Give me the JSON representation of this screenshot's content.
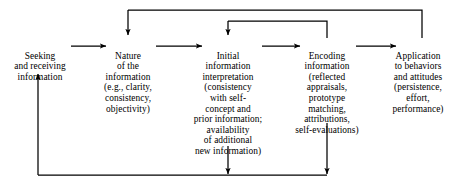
{
  "diagram": {
    "type": "process-flow",
    "background_color": "#ffffff",
    "line_color": "#000000",
    "text_color": "#000000",
    "nodes": [
      {
        "id": "seeking",
        "label": "Seeking",
        "lines": [
          "Seeking",
          "and receiving",
          "information"
        ],
        "text": "Seeking\nand receiving\ninformation"
      },
      {
        "id": "nature",
        "label": "Nature",
        "lines": [
          "Nature",
          "of the",
          "information",
          "(e.g., clarity,",
          "consistency,",
          "objectivity)"
        ],
        "text": "Nature\nof the\ninformation\n(e.g., clarity,\nconsistency,\nobjectivity)"
      },
      {
        "id": "initial-interpretation",
        "label": "Initial",
        "lines": [
          "Initial",
          "information",
          "interpretation",
          "(consistency",
          "with self-",
          "concept and",
          "prior information;",
          "availability",
          "of additional",
          "new information)"
        ],
        "text": "Initial\ninformation\ninterpretation\n(consistency\nwith self-\nconcept and\nprior information;\navailability\nof additional\nnew information)"
      },
      {
        "id": "encoding",
        "label": "Encoding",
        "lines": [
          "Encoding",
          "information",
          "(reflected",
          "appraisals,",
          "prototype",
          "matching,",
          "attributions,",
          "self-evaluations)"
        ],
        "text": "Encoding\ninformation\n(reflected\nappraisals,\nprototype\nmatching,\nattributions,\nself-evaluations)"
      },
      {
        "id": "application",
        "label": "Application",
        "lines": [
          "Application",
          "to behaviors",
          "and attitudes",
          "(persistence,",
          "effort,",
          "performance)"
        ],
        "text": "Application\nto behaviors\nand attitudes\n(persistence,\neffort,\nperformance)"
      }
    ],
    "edges": [
      {
        "id": "seeking-to-nature",
        "from": "seeking",
        "to": "nature",
        "style": "arrow-right"
      },
      {
        "id": "nature-to-initial",
        "from": "nature",
        "to": "initial-interpretation",
        "style": "arrow-right"
      },
      {
        "id": "initial-to-encoding",
        "from": "initial-interpretation",
        "to": "encoding",
        "style": "arrow-right"
      },
      {
        "id": "encoding-to-application",
        "from": "encoding",
        "to": "application",
        "style": "arrow-right"
      },
      {
        "id": "application-to-nature-feedback",
        "from": "application",
        "to": "nature",
        "style": "feedback-top"
      },
      {
        "id": "encoding-to-initial-feedback",
        "from": "encoding",
        "to": "initial-interpretation",
        "style": "feedback-top"
      },
      {
        "id": "bottom-feedback-to-seeking",
        "from": "initial-interpretation, encoding",
        "to": "seeking",
        "style": "feedback-bottom"
      }
    ]
  }
}
